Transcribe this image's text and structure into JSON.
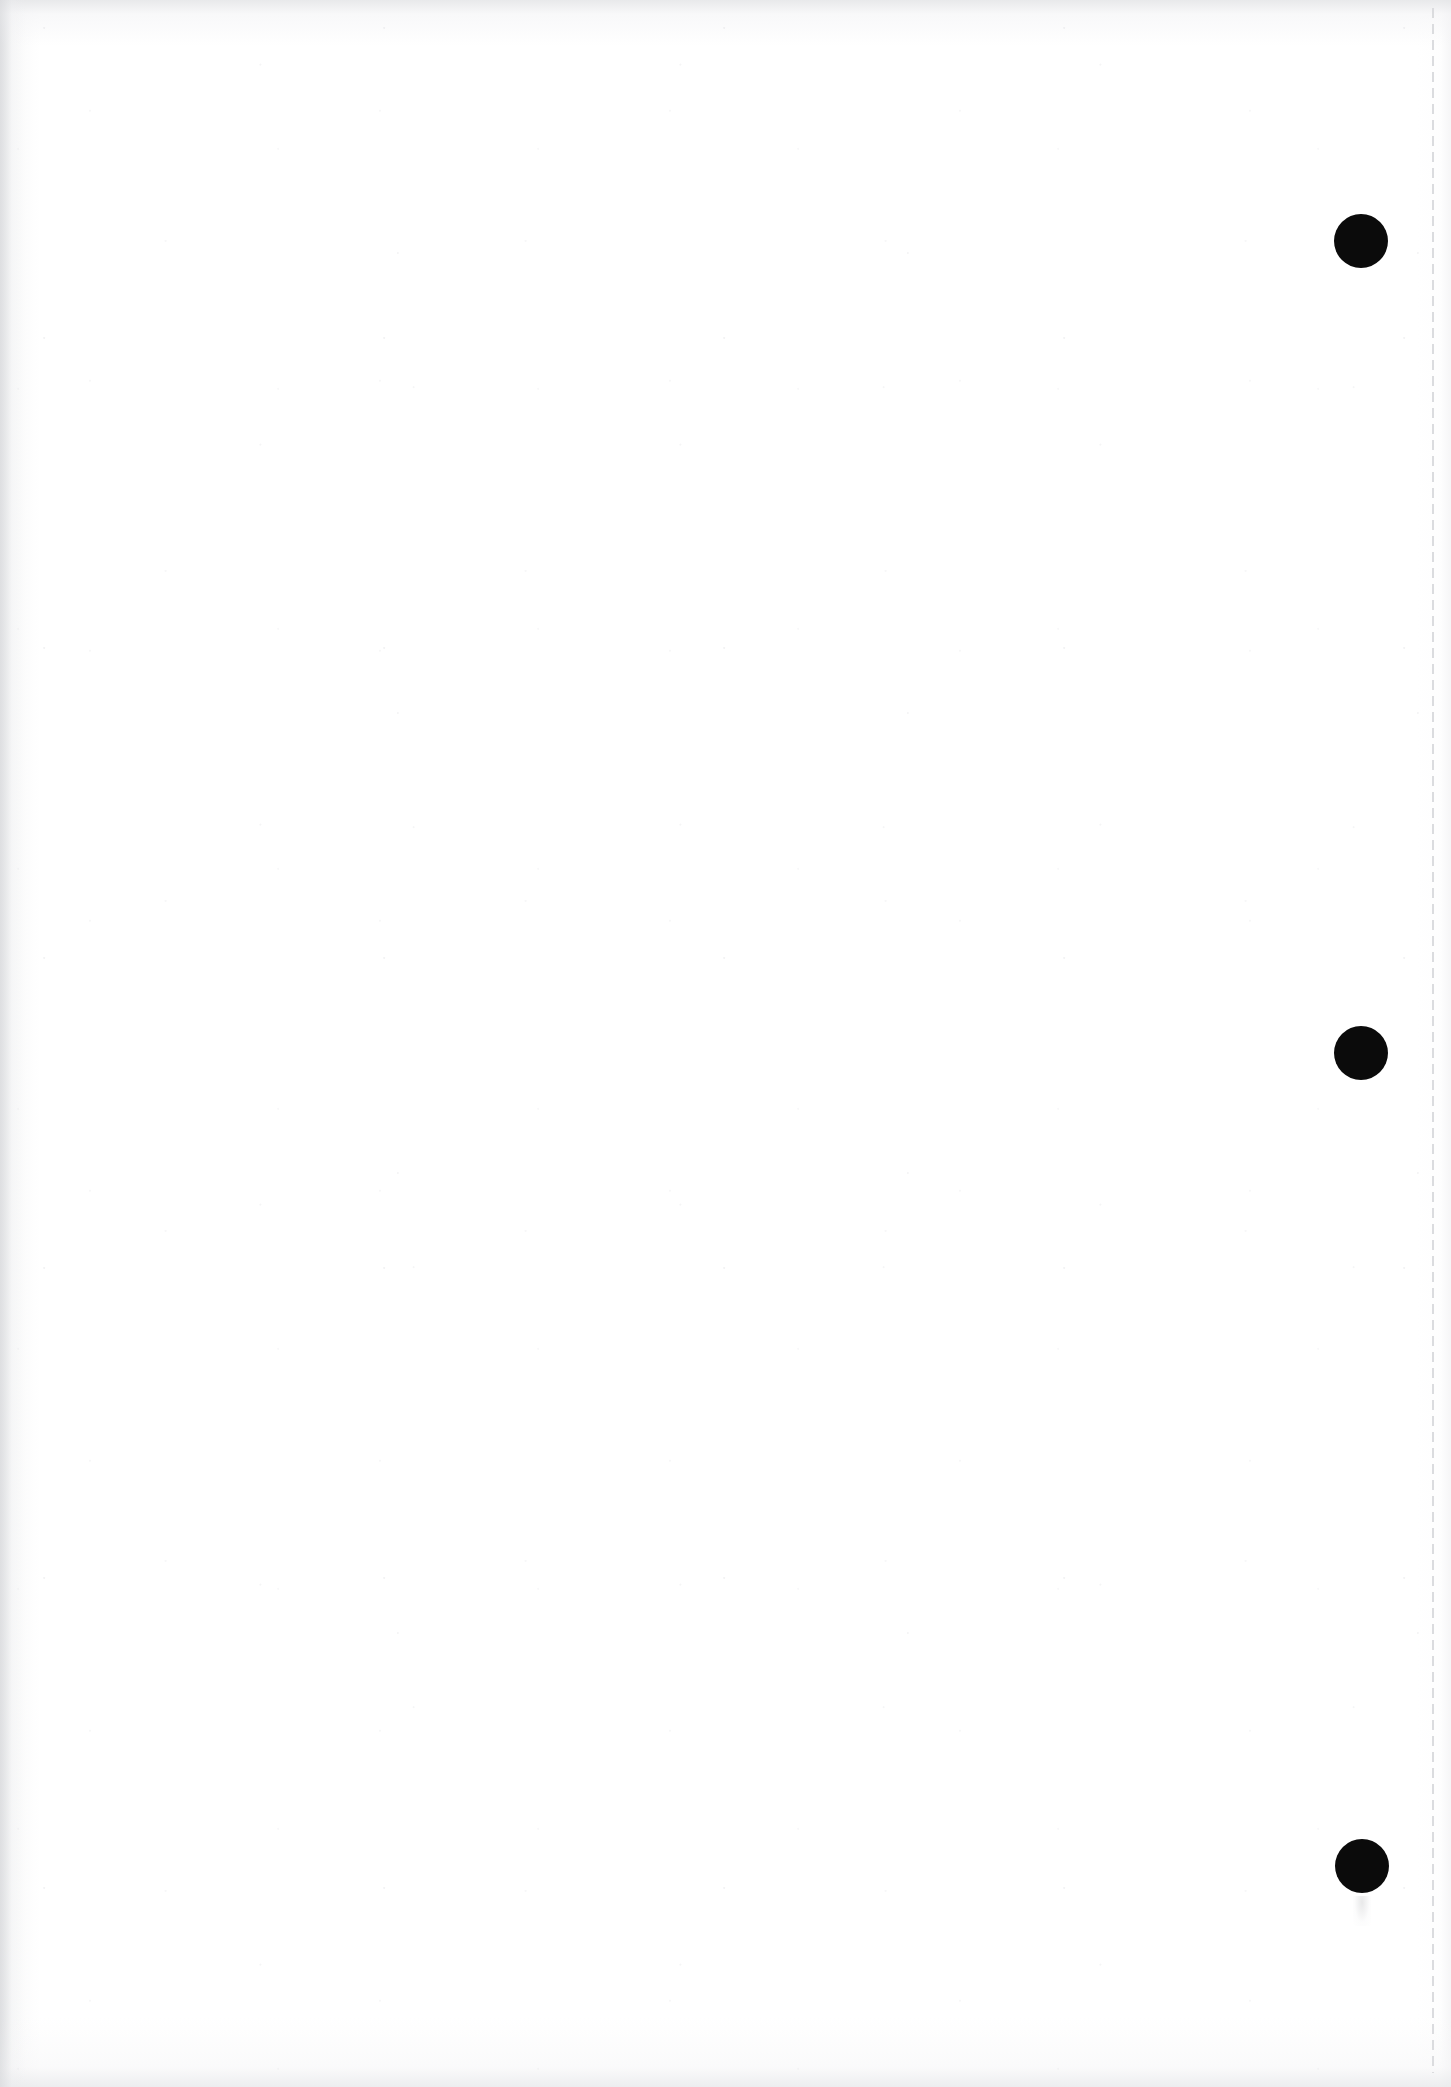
{
  "document": {
    "title": "",
    "page_body_text": "",
    "background_color": "#ffffff",
    "page_width": 1451,
    "page_height": 2087,
    "content_summary": "blank scanned page"
  },
  "margin_rule": {
    "name": "dashed-margin-rule",
    "orientation": "vertical",
    "color": "#d9dadd",
    "x": 1432,
    "y_start": 8,
    "y_end": 2073,
    "dash_length": 10,
    "gap_length": 6,
    "thickness": 2
  },
  "marks": {
    "color": "#0b0b0b",
    "count": 3,
    "items": [
      {
        "label": "punch-mark-1",
        "cx": 1361,
        "cy": 241,
        "r": 27
      },
      {
        "label": "punch-mark-2",
        "cx": 1361,
        "cy": 1053,
        "r": 27
      },
      {
        "label": "punch-mark-3",
        "cx": 1362,
        "cy": 1866,
        "r": 27
      }
    ]
  },
  "artifacts": {
    "left_edge_shadow": true,
    "top_edge_shadow": true,
    "bottom_edge_shadow": true,
    "paper_grain": true,
    "ink_smudge": {
      "label": "ink-smudge",
      "x": 1353,
      "y": 1896
    }
  }
}
